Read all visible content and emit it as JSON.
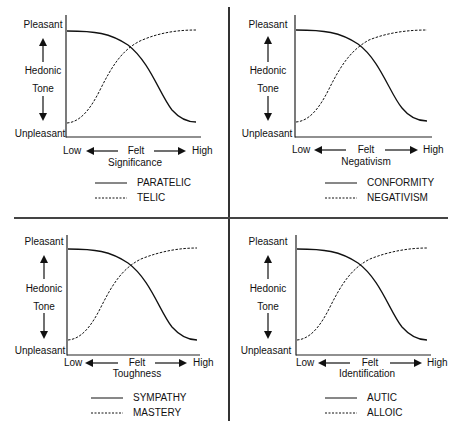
{
  "panels": [
    {
      "id": "significance",
      "y_axis": {
        "top": "Pleasant",
        "middle1": "Hedonic",
        "middle2": "Tone",
        "bottom": "Unpleasant"
      },
      "x_axis": {
        "low": "Low",
        "center": "Felt",
        "high": "High",
        "variable": "Significance"
      },
      "legend": [
        {
          "style": "solid",
          "label": "PARATELIC"
        },
        {
          "style": "dashed",
          "label": "TELIC"
        }
      ]
    },
    {
      "id": "negativism",
      "y_axis": {
        "top": "Pleasant",
        "middle1": "Hedonic",
        "middle2": "Tone",
        "bottom": "Unpleasant"
      },
      "x_axis": {
        "low": "Low",
        "center": "Felt",
        "high": "High",
        "variable": "Negativism"
      },
      "legend": [
        {
          "style": "solid",
          "label": "CONFORMITY"
        },
        {
          "style": "dashed",
          "label": "NEGATIVISM"
        }
      ]
    },
    {
      "id": "toughness",
      "y_axis": {
        "top": "Pleasant",
        "middle1": "Hedonic",
        "middle2": "Tone",
        "bottom": "Unpleasant"
      },
      "x_axis": {
        "low": "Low",
        "center": "Felt",
        "high": "High",
        "variable": "Toughness"
      },
      "legend": [
        {
          "style": "solid",
          "label": "SYMPATHY"
        },
        {
          "style": "dashed",
          "label": "MASTERY"
        }
      ]
    },
    {
      "id": "identification",
      "y_axis": {
        "top": "Pleasant",
        "middle1": "Hedonic",
        "middle2": "Tone",
        "bottom": "Unpleasant"
      },
      "x_axis": {
        "low": "Low",
        "center": "Felt",
        "high": "High",
        "variable": "Identification"
      },
      "legend": [
        {
          "style": "solid",
          "label": "AUTIC"
        },
        {
          "style": "dashed",
          "label": "ALLOIC"
        }
      ]
    }
  ],
  "colors": {
    "ink": "#111111",
    "background": "#ffffff"
  }
}
